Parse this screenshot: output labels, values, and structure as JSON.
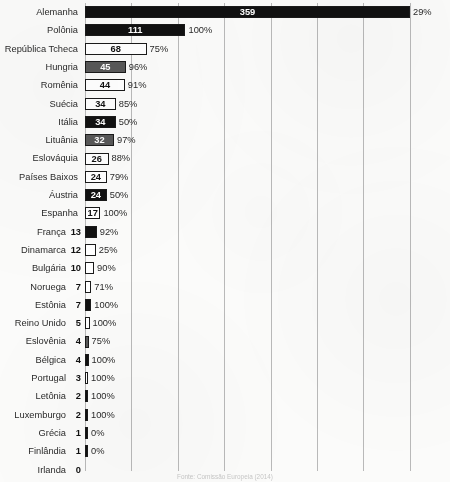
{
  "chart_data": {
    "type": "bar",
    "orientation": "horizontal",
    "title": "",
    "xlabel": "",
    "ylabel": "",
    "xlim": [
      0,
      403
    ],
    "grid": "vertical",
    "legend": "none",
    "value_series_name": "Quantidade",
    "percent_series_name": "Percentual",
    "categories": [
      "Alemanha",
      "Polônia",
      "República Tcheca",
      "Hungria",
      "Romênia",
      "Suécia",
      "Itália",
      "Lituânia",
      "Eslováquia",
      "Países Baixos",
      "Áustria",
      "Espanha",
      "França",
      "Dinamarca",
      "Bulgária",
      "Noruega",
      "Estônia",
      "Reino Unido",
      "Eslovênia",
      "Bélgica",
      "Portugal",
      "Letônia",
      "Luxemburgo",
      "Grécia",
      "Finlândia",
      "Irlanda"
    ],
    "values": [
      359,
      111,
      68,
      45,
      44,
      34,
      34,
      32,
      26,
      24,
      24,
      17,
      13,
      12,
      10,
      7,
      7,
      5,
      4,
      4,
      3,
      2,
      2,
      1,
      1,
      0
    ],
    "percents": [
      "29%",
      "100%",
      "75%",
      "96%",
      "91%",
      "85%",
      "50%",
      "97%",
      "88%",
      "79%",
      "50%",
      "100%",
      "92%",
      "25%",
      "90%",
      "71%",
      "100%",
      "100%",
      "75%",
      "100%",
      "100%",
      "100%",
      "100%",
      "0%",
      "0%",
      ""
    ],
    "bar_styles": [
      "black",
      "black",
      "white",
      "gray",
      "white",
      "white",
      "black",
      "gray",
      "white",
      "white",
      "black",
      "white",
      "black",
      "white",
      "white",
      "white",
      "black",
      "white",
      "gray",
      "black",
      "white",
      "black",
      "black",
      "black",
      "black",
      "black"
    ],
    "value_inside_bar": [
      true,
      true,
      true,
      true,
      true,
      true,
      true,
      true,
      true,
      true,
      true,
      true,
      false,
      false,
      false,
      false,
      false,
      false,
      false,
      false,
      false,
      false,
      false,
      false,
      false,
      false
    ],
    "rows": [
      {
        "label": "Alemanha",
        "value": 359,
        "percent": "29%",
        "style": "black",
        "inside": true
      },
      {
        "label": "Polônia",
        "value": 111,
        "percent": "100%",
        "style": "black",
        "inside": true
      },
      {
        "label": "República Tcheca",
        "value": 68,
        "percent": "75%",
        "style": "white",
        "inside": true
      },
      {
        "label": "Hungria",
        "value": 45,
        "percent": "96%",
        "style": "gray",
        "inside": true
      },
      {
        "label": "Romênia",
        "value": 44,
        "percent": "91%",
        "style": "white",
        "inside": true
      },
      {
        "label": "Suécia",
        "value": 34,
        "percent": "85%",
        "style": "white",
        "inside": true
      },
      {
        "label": "Itália",
        "value": 34,
        "percent": "50%",
        "style": "black",
        "inside": true
      },
      {
        "label": "Lituânia",
        "value": 32,
        "percent": "97%",
        "style": "gray",
        "inside": true
      },
      {
        "label": "Eslováquia",
        "value": 26,
        "percent": "88%",
        "style": "white",
        "inside": true
      },
      {
        "label": "Países Baixos",
        "value": 24,
        "percent": "79%",
        "style": "white",
        "inside": true
      },
      {
        "label": "Áustria",
        "value": 24,
        "percent": "50%",
        "style": "black",
        "inside": true
      },
      {
        "label": "Espanha",
        "value": 17,
        "percent": "100%",
        "style": "white",
        "inside": true
      },
      {
        "label": "França",
        "value": 13,
        "percent": "92%",
        "style": "black",
        "inside": false
      },
      {
        "label": "Dinamarca",
        "value": 12,
        "percent": "25%",
        "style": "white",
        "inside": false
      },
      {
        "label": "Bulgária",
        "value": 10,
        "percent": "90%",
        "style": "white",
        "inside": false
      },
      {
        "label": "Noruega",
        "value": 7,
        "percent": "71%",
        "style": "white",
        "inside": false
      },
      {
        "label": "Estônia",
        "value": 7,
        "percent": "100%",
        "style": "black",
        "inside": false
      },
      {
        "label": "Reino Unido",
        "value": 5,
        "percent": "100%",
        "style": "white",
        "inside": false
      },
      {
        "label": "Eslovênia",
        "value": 4,
        "percent": "75%",
        "style": "gray",
        "inside": false
      },
      {
        "label": "Bélgica",
        "value": 4,
        "percent": "100%",
        "style": "black",
        "inside": false
      },
      {
        "label": "Portugal",
        "value": 3,
        "percent": "100%",
        "style": "white",
        "inside": false
      },
      {
        "label": "Letônia",
        "value": 2,
        "percent": "100%",
        "style": "black",
        "inside": false
      },
      {
        "label": "Luxemburgo",
        "value": 2,
        "percent": "100%",
        "style": "black",
        "inside": false
      },
      {
        "label": "Grécia",
        "value": 1,
        "percent": "0%",
        "style": "black",
        "inside": false
      },
      {
        "label": "Finlândia",
        "value": 1,
        "percent": "0%",
        "style": "black",
        "inside": false
      },
      {
        "label": "Irlanda",
        "value": 0,
        "percent": "",
        "style": "black",
        "inside": false
      }
    ],
    "gridline_count": 8
  },
  "footer": {
    "source": "Fonte: Comissão Europeia (2014)"
  },
  "colors": {
    "bar_black": "#111111",
    "bar_gray": "#585858",
    "bar_white": "#ffffff",
    "bar_border": "#1a1a1a",
    "gridline": "#b9b9b9",
    "axis": "#4a4a4a",
    "text": "#2a2a2a",
    "background": "#fbfbfa"
  }
}
